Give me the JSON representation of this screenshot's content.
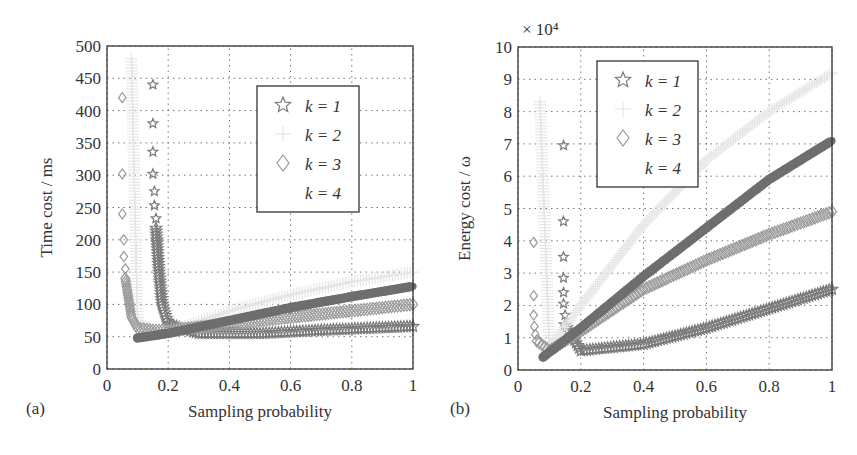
{
  "figure": {
    "panels": [
      {
        "panel_label": "(a)",
        "xlabel": "Sampling probability",
        "ylabel": "Time cost / ms",
        "exponent_label": "",
        "legend": [
          "k = 1",
          "k = 2",
          "k = 3",
          "k = 4"
        ]
      },
      {
        "panel_label": "(b)",
        "xlabel": "Sampling probability",
        "ylabel": "Energy cost / ω",
        "exponent_label": "× 10⁴",
        "legend": [
          "k = 1",
          "k = 2",
          "k = 3",
          "k = 4"
        ]
      }
    ]
  },
  "chart_data": [
    {
      "type": "scatter",
      "title": "(a)",
      "xlabel": "Sampling probability",
      "ylabel": "Time cost / ms",
      "xlim": [
        0,
        1
      ],
      "ylim": [
        0,
        500
      ],
      "xticks": [
        "0",
        "0.2",
        "0.4",
        "0.6",
        "0.8",
        "1"
      ],
      "yticks": [
        "0",
        "50",
        "100",
        "150",
        "200",
        "250",
        "300",
        "350",
        "400",
        "450",
        "500"
      ],
      "grid": true,
      "legend_position": "upper right",
      "series": [
        {
          "name": "k = 1",
          "marker": "star",
          "color": "#7a7a7a",
          "x": [
            0.15,
            0.15,
            0.15,
            0.15,
            0.155,
            0.155,
            0.16,
            0.16,
            0.17,
            0.18,
            0.2,
            0.3,
            0.5,
            0.7,
            0.9,
            1.0
          ],
          "y": [
            440,
            380,
            336,
            302,
            275,
            253,
            233,
            218,
            150,
            100,
            70,
            55,
            55,
            60,
            64,
            66
          ]
        },
        {
          "name": "k = 2",
          "marker": "plus",
          "color": "#e6e6e6",
          "x": [
            0.08,
            0.1,
            0.15,
            0.2,
            0.4,
            0.6,
            0.8,
            1.0
          ],
          "y": [
            480,
            75,
            60,
            58,
            90,
            115,
            135,
            150
          ]
        },
        {
          "name": "k = 3",
          "marker": "diamond",
          "color": "#9a9a9a",
          "x": [
            0.05,
            0.05,
            0.05,
            0.055,
            0.055,
            0.06,
            0.06,
            0.07,
            0.08,
            0.1,
            0.15,
            0.2,
            0.4,
            0.6,
            0.8,
            0.9,
            1.0
          ],
          "y": [
            420,
            302,
            240,
            200,
            174,
            155,
            140,
            110,
            80,
            63,
            60,
            60,
            70,
            80,
            90,
            95,
            100
          ]
        },
        {
          "name": "k = 4",
          "marker": "point",
          "color": "#6e6e6e",
          "x": [
            0.1,
            0.2,
            0.4,
            0.6,
            0.8,
            1.0
          ],
          "y": [
            48,
            55,
            75,
            95,
            112,
            128
          ]
        }
      ]
    },
    {
      "type": "scatter",
      "title": "(b)",
      "xlabel": "Sampling probability",
      "ylabel": "Energy cost / ω (×10^4)",
      "xlim": [
        0,
        1
      ],
      "ylim": [
        0,
        10
      ],
      "xticks": [
        "0",
        "0.2",
        "0.4",
        "0.6",
        "0.8",
        "1"
      ],
      "yticks": [
        "0",
        "1",
        "2",
        "3",
        "4",
        "5",
        "6",
        "7",
        "8",
        "9",
        "10"
      ],
      "grid": true,
      "legend_position": "upper center",
      "series": [
        {
          "name": "k = 1",
          "marker": "star",
          "color": "#7a7a7a",
          "x": [
            0.145,
            0.145,
            0.145,
            0.145,
            0.145,
            0.145,
            0.15,
            0.15,
            0.2,
            0.4,
            0.6,
            0.8,
            1.0
          ],
          "y": [
            6.95,
            4.6,
            3.5,
            2.85,
            2.4,
            2.05,
            1.7,
            1.4,
            0.6,
            0.8,
            1.3,
            1.9,
            2.5
          ]
        },
        {
          "name": "k = 2",
          "marker": "plus",
          "color": "#e6e6e6",
          "x": [
            0.07,
            0.1,
            0.2,
            0.4,
            0.6,
            0.8,
            1.0
          ],
          "y": [
            8.3,
            0.7,
            2.0,
            4.5,
            6.5,
            8.0,
            9.2
          ]
        },
        {
          "name": "k = 3",
          "marker": "diamond",
          "color": "#9a9a9a",
          "x": [
            0.05,
            0.05,
            0.05,
            0.052,
            0.055,
            0.06,
            0.1,
            0.2,
            0.4,
            0.6,
            0.8,
            1.0
          ],
          "y": [
            3.95,
            2.3,
            1.7,
            1.35,
            1.1,
            0.9,
            0.6,
            1.2,
            2.5,
            3.4,
            4.2,
            4.9
          ]
        },
        {
          "name": "k = 4",
          "marker": "point",
          "color": "#6e6e6e",
          "x": [
            0.08,
            0.2,
            0.4,
            0.6,
            0.8,
            1.0
          ],
          "y": [
            0.4,
            1.3,
            2.9,
            4.4,
            5.9,
            7.1
          ]
        }
      ]
    }
  ]
}
